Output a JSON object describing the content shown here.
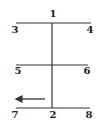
{
  "diagram": {
    "type": "labeled-line-diagram",
    "line_color": "#333333",
    "label_color": "#222222",
    "lines": [
      {
        "id": "top-horizontal",
        "x1": 16,
        "y1": 23,
        "x2": 91,
        "y2": 23
      },
      {
        "id": "vertical-spine",
        "x1": 52,
        "y1": 23,
        "x2": 52,
        "y2": 108
      },
      {
        "id": "middle-horizontal",
        "x1": 16,
        "y1": 65,
        "x2": 88,
        "y2": 65
      },
      {
        "id": "bottom-horizontal",
        "x1": 16,
        "y1": 108,
        "x2": 90,
        "y2": 108
      }
    ],
    "arrow": {
      "id": "left-arrow",
      "x1": 45,
      "y1": 99,
      "x2": 16,
      "y2": 99,
      "direction": "left"
    },
    "labels": [
      {
        "text": "1",
        "x": 53,
        "y": 14
      },
      {
        "text": "3",
        "x": 15,
        "y": 30
      },
      {
        "text": "4",
        "x": 90,
        "y": 30
      },
      {
        "text": "5",
        "x": 18,
        "y": 71
      },
      {
        "text": "6",
        "x": 87,
        "y": 71
      },
      {
        "text": "7",
        "x": 15,
        "y": 115
      },
      {
        "text": "2",
        "x": 53,
        "y": 115
      },
      {
        "text": "8",
        "x": 89,
        "y": 115
      }
    ]
  }
}
